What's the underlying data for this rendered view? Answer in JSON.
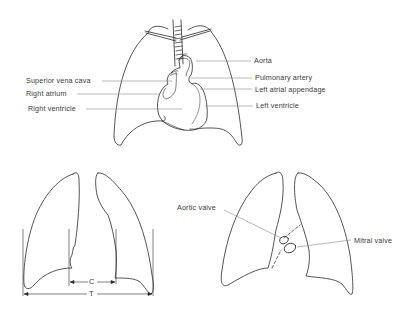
{
  "figure": {
    "top": {
      "name": "heart-in-chest",
      "labels_left": [
        {
          "id": "superior-vena-cava",
          "text": "Superior vena cava",
          "x": 26,
          "y": 77
        },
        {
          "id": "right-atrium",
          "text": "Right atrium",
          "x": 26,
          "y": 90
        },
        {
          "id": "right-ventricle",
          "text": "Right ventricle",
          "x": 28,
          "y": 105
        }
      ],
      "labels_right": [
        {
          "id": "aorta",
          "text": "Aorta",
          "x": 254,
          "y": 57
        },
        {
          "id": "pulmonary-artery",
          "text": "Pulmonary artery",
          "x": 255,
          "y": 74
        },
        {
          "id": "left-atrial-appendage",
          "text": "Left atrial appendage",
          "x": 255,
          "y": 86
        },
        {
          "id": "left-ventricle",
          "text": "Left ventricle",
          "x": 256,
          "y": 102
        }
      ]
    },
    "bottom_left": {
      "name": "cardiothoracic-ratio",
      "dimension_labels": {
        "cardiac": "C",
        "thoracic": "T"
      }
    },
    "bottom_right": {
      "name": "valve-positions",
      "labels": [
        {
          "id": "aortic-valve",
          "text": "Aortic valve",
          "x": 177,
          "y": 204
        },
        {
          "id": "mitral-valve",
          "text": "Mitral valve",
          "x": 354,
          "y": 237
        }
      ]
    }
  },
  "colors": {
    "line": "#2a2a2a",
    "leader": "#8a8a8a",
    "text": "#3a3a3a",
    "background": "#ffffff"
  }
}
